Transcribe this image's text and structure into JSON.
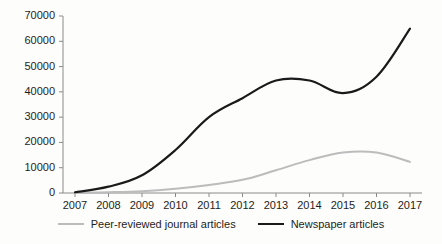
{
  "chart_data": {
    "type": "line",
    "title": "",
    "subtitle": "",
    "xlabel": "",
    "ylabel": "",
    "grid": false,
    "legend_position": "bottom",
    "categories": [
      "2007",
      "2008",
      "2009",
      "2010",
      "2011",
      "2012",
      "2013",
      "2014",
      "2015",
      "2016",
      "2017"
    ],
    "x": [
      2007,
      2008,
      2009,
      2010,
      2011,
      2012,
      2013,
      2014,
      2015,
      2016,
      2017
    ],
    "xlim": [
      2007,
      2017
    ],
    "ylim": [
      0,
      70000
    ],
    "y_ticks": [
      0,
      10000,
      20000,
      30000,
      40000,
      50000,
      60000,
      70000
    ],
    "y_tick_labels": [
      "0",
      "10000",
      "20000",
      "30000",
      "40000",
      "50000",
      "60000",
      "70000"
    ],
    "x_tick_labels": [
      "2007",
      "2008",
      "2009",
      "2010",
      "2011",
      "2012",
      "2013",
      "2014",
      "2015",
      "2016",
      "2017"
    ],
    "series": [
      {
        "name": "Peer-reviewed journal articles",
        "color": "#bcbcbc",
        "width": 2,
        "values": [
          100,
          300,
          700,
          1700,
          3200,
          5200,
          9000,
          13000,
          16000,
          16000,
          12300
        ]
      },
      {
        "name": "Newspaper articles",
        "color": "#1a1a1a",
        "width": 2.2,
        "values": [
          300,
          2500,
          7000,
          17000,
          30000,
          37500,
          44500,
          44500,
          39500,
          46000,
          65000
        ]
      }
    ]
  },
  "legend": {
    "entries": [
      {
        "label": "Peer-reviewed journal articles",
        "color": "#bcbcbc"
      },
      {
        "label": "Newspaper articles",
        "color": "#1a1a1a"
      }
    ]
  },
  "axes": {
    "axis_color": "#8a8a8a"
  }
}
